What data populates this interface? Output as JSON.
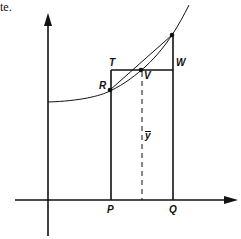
{
  "fragment_text": "te.",
  "labels": {
    "T": "T",
    "R": "R",
    "V": "V",
    "W": "W",
    "P": "P",
    "Q": "Q",
    "ybar": "y"
  },
  "colors": {
    "ink": "#111111",
    "background": "#ffffff"
  }
}
